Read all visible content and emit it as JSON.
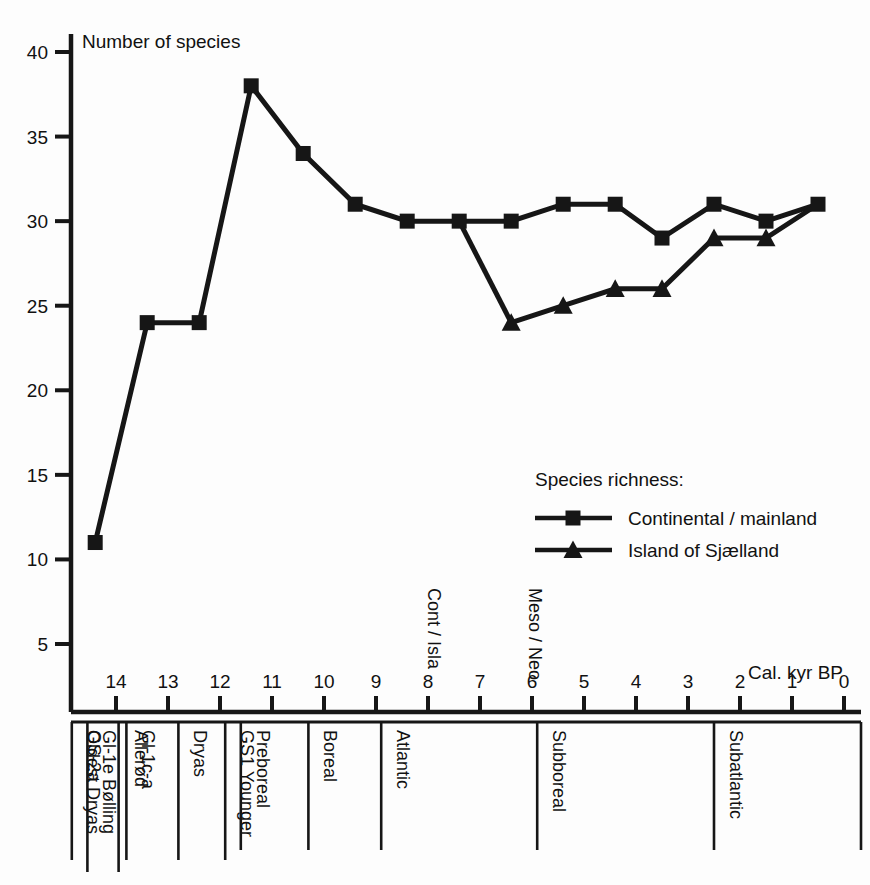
{
  "chart_data": {
    "type": "line",
    "title": "",
    "ylabel": "Number of species",
    "xlabel": "Cal. kyr BP",
    "ylim": [
      0,
      40
    ],
    "xlim": [
      15,
      0
    ],
    "x_reversed": true,
    "grid": false,
    "y_ticks": [
      5,
      10,
      15,
      20,
      25,
      30,
      35,
      40
    ],
    "x_ticks": [
      14,
      13,
      12,
      11,
      10,
      9,
      8,
      7,
      6,
      5,
      4,
      3,
      2,
      1,
      0
    ],
    "legend_title": "Species richness:",
    "legend_position": "inside-center-right",
    "series": [
      {
        "name": "Continental / mainland",
        "marker": "square",
        "color": "#161616",
        "points": [
          {
            "x": 14.4,
            "y": 11
          },
          {
            "x": 13.4,
            "y": 24
          },
          {
            "x": 12.4,
            "y": 24
          },
          {
            "x": 11.4,
            "y": 38
          },
          {
            "x": 10.4,
            "y": 34
          },
          {
            "x": 9.4,
            "y": 31
          },
          {
            "x": 8.4,
            "y": 30
          },
          {
            "x": 7.4,
            "y": 30
          },
          {
            "x": 6.4,
            "y": 30
          },
          {
            "x": 5.4,
            "y": 31
          },
          {
            "x": 4.4,
            "y": 31
          },
          {
            "x": 3.5,
            "y": 29
          },
          {
            "x": 2.5,
            "y": 31
          },
          {
            "x": 1.5,
            "y": 30
          },
          {
            "x": 0.5,
            "y": 31
          }
        ]
      },
      {
        "name": "Island of Sjælland",
        "marker": "triangle",
        "color": "#161616",
        "points": [
          {
            "x": 6.4,
            "y": 24
          },
          {
            "x": 5.4,
            "y": 25
          },
          {
            "x": 4.4,
            "y": 26
          },
          {
            "x": 3.5,
            "y": 26
          },
          {
            "x": 2.5,
            "y": 29
          },
          {
            "x": 1.5,
            "y": 29
          },
          {
            "x": 0.5,
            "y": 31
          }
        ]
      }
    ],
    "connector_note": "Island series branches from mainland point at 7.4 kyr",
    "annotations": [
      {
        "text": "Cont / Isla",
        "x": 8.0,
        "orientation": "vertical"
      },
      {
        "text": "Meso / Neo",
        "x": 6.05,
        "orientation": "vertical"
      }
    ],
    "stratigraphy": [
      {
        "label": "Oldest Dryas",
        "start": 15.0,
        "end": 14.85
      },
      {
        "label": "GS-2a",
        "start": 14.85,
        "end": 14.55
      },
      {
        "label": "Gl-1e  Bølling",
        "start": 14.55,
        "end": 13.95
      },
      {
        "label": "Allerød",
        "start": 13.95,
        "end": 13.8
      },
      {
        "label": "Gl-1c-a",
        "start": 13.8,
        "end": 12.8
      },
      {
        "label": "Dryas",
        "start": 12.8,
        "end": 11.9
      },
      {
        "label": "GS1 Younger",
        "start": 11.9,
        "end": 11.6
      },
      {
        "label": "Preboreal",
        "start": 11.6,
        "end": 10.3
      },
      {
        "label": "Boreal",
        "start": 10.3,
        "end": 8.9
      },
      {
        "label": "Atlantic",
        "start": 8.9,
        "end": 5.9
      },
      {
        "label": "Subboreal",
        "start": 5.9,
        "end": 2.5
      },
      {
        "label": "Subatlantic",
        "start": 2.5,
        "end": 0.0
      }
    ]
  },
  "axis": {
    "y_title": "Number of species",
    "x_title": "Cal. kyr BP",
    "y_tick_labels": [
      "40",
      "35",
      "30",
      "25",
      "20",
      "15",
      "10",
      "5"
    ],
    "x_tick_labels": [
      "14",
      "13",
      "12",
      "11",
      "10",
      "9",
      "8",
      "7",
      "6",
      "5",
      "4",
      "3",
      "2",
      "1",
      "0"
    ]
  },
  "legend": {
    "title": "Species richness:",
    "entries": [
      {
        "label": "Continental / mainland",
        "marker": "square"
      },
      {
        "label": "Island of Sjælland",
        "marker": "triangle"
      }
    ]
  },
  "annotations": {
    "cont_isla": "Cont / Isla",
    "meso_neo": "Meso / Neo"
  },
  "zones": {
    "labels": [
      "Oldest Dryas",
      "GS-2a",
      "Gl-1e  Bølling",
      "Allerød",
      "Gl-1c-a",
      "Dryas",
      "GS1 Younger",
      "Preboreal",
      "Boreal",
      "Atlantic",
      "Subboreal",
      "Subatlantic"
    ]
  },
  "colors": {
    "ink": "#161616",
    "background": "#fdfdfd"
  }
}
